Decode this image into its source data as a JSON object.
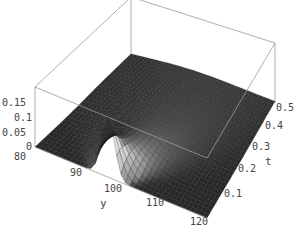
{
  "chart_data": {
    "type": "surface3d",
    "title": "",
    "x_axis": {
      "label": "y",
      "ticks": [
        "80",
        "90",
        "100",
        "110",
        "120"
      ],
      "range": [
        80,
        120
      ]
    },
    "y_axis": {
      "label": "t",
      "ticks": [
        "0.1",
        "0.2",
        "0.3",
        "0.4",
        "0.5"
      ],
      "range": [
        0,
        0.5
      ]
    },
    "z_axis": {
      "label": "",
      "ticks": [
        "0",
        "0.05",
        "0.1",
        "0.15"
      ],
      "range": [
        0,
        0.18
      ]
    },
    "surface": {
      "peak": {
        "y": 97,
        "t": 0.0,
        "z": 0.18
      },
      "model": "z = a(t) * exp(-(y-97)^2 / (2*s(t)^2)), s(t)=1.5+25t, area-preserving"
    },
    "colors": {
      "surface": "#2a2a2a",
      "highlight": "#d8d8d8",
      "box": "#9a9a9a",
      "text": "#444444"
    }
  },
  "labels": {
    "z_ticks": [
      "0.15",
      "0.1",
      "0.05",
      "0"
    ],
    "y_ticks": [
      "80",
      "90",
      "100",
      "110",
      "120"
    ],
    "t_ticks": [
      "0.5",
      "0.4",
      "0.3",
      "0.2",
      "0.1"
    ],
    "y_axis_label": "y",
    "t_axis_label": "t"
  }
}
